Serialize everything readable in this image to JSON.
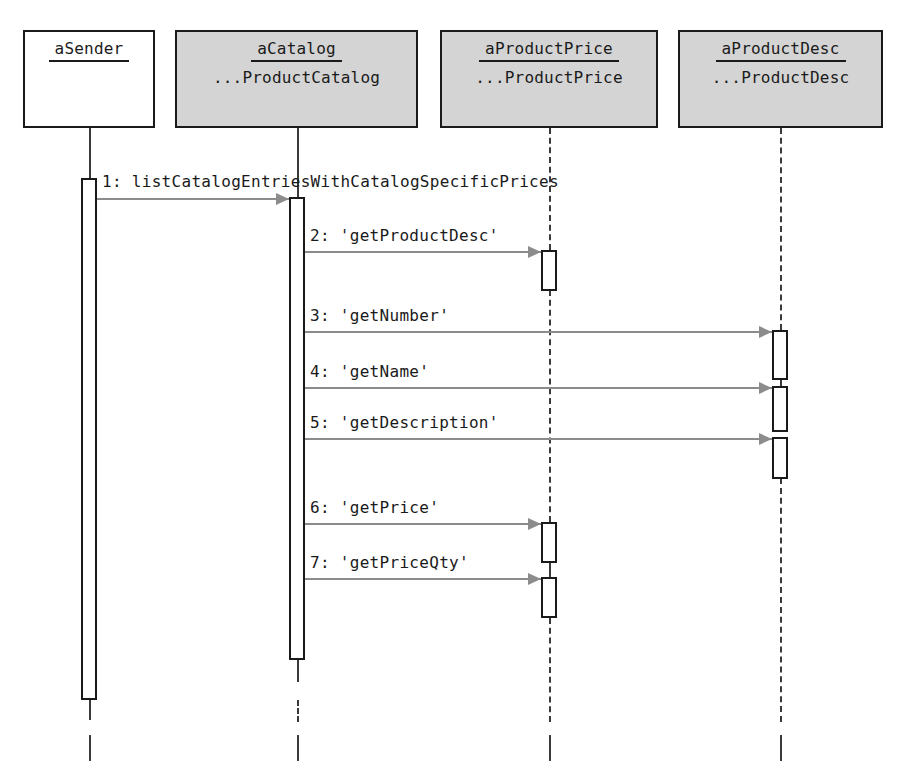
{
  "diagram": {
    "type": "uml-sequence-diagram",
    "title": "",
    "background_color": "#ffffff",
    "line_color": "#1a1a1a",
    "message_color": "#8c8c8c",
    "shaded_box_color": "#d4d4d4"
  },
  "participants": [
    {
      "id": "aSender",
      "name": "aSender",
      "class": "",
      "shaded": false,
      "box": {
        "x": 23,
        "y": 30,
        "w": 132,
        "h": 98
      },
      "lifeline_x": 89
    },
    {
      "id": "aCatalog",
      "name": "aCatalog",
      "class": "...ProductCatalog",
      "shaded": true,
      "box": {
        "x": 175,
        "y": 30,
        "w": 243,
        "h": 98
      },
      "lifeline_x": 297
    },
    {
      "id": "aProductPrice",
      "name": "aProductPrice",
      "class": "...ProductPrice",
      "shaded": true,
      "box": {
        "x": 440,
        "y": 30,
        "w": 218,
        "h": 98
      },
      "lifeline_x": 549
    },
    {
      "id": "aProductDesc",
      "name": "aProductDesc",
      "class": "...ProductDesc",
      "shaded": true,
      "box": {
        "x": 678,
        "y": 30,
        "w": 205,
        "h": 98
      },
      "lifeline_x": 780
    }
  ],
  "lifeline_segments": [
    {
      "participant": "aSender",
      "x": 89,
      "y": 128,
      "h": 52,
      "style": "solid"
    },
    {
      "participant": "aSender",
      "x": 89,
      "y": 698,
      "h": 22,
      "style": "solid"
    },
    {
      "participant": "aSender",
      "x": 89,
      "y": 735,
      "h": 26,
      "style": "solid"
    },
    {
      "participant": "aCatalog",
      "x": 297,
      "y": 128,
      "h": 70,
      "style": "solid"
    },
    {
      "participant": "aCatalog",
      "x": 297,
      "y": 660,
      "h": 22,
      "style": "solid"
    },
    {
      "participant": "aCatalog",
      "x": 297,
      "y": 700,
      "h": 22,
      "style": "dashed"
    },
    {
      "participant": "aCatalog",
      "x": 297,
      "y": 735,
      "h": 26,
      "style": "solid"
    },
    {
      "participant": "aProductPrice",
      "x": 549,
      "y": 128,
      "h": 122,
      "style": "dashed"
    },
    {
      "participant": "aProductPrice",
      "x": 549,
      "y": 290,
      "h": 232,
      "style": "dashed"
    },
    {
      "participant": "aProductPrice",
      "x": 549,
      "y": 563,
      "h": 14,
      "style": "solid"
    },
    {
      "participant": "aProductPrice",
      "x": 549,
      "y": 618,
      "h": 104,
      "style": "dashed"
    },
    {
      "participant": "aProductPrice",
      "x": 549,
      "y": 735,
      "h": 26,
      "style": "solid"
    },
    {
      "participant": "aProductDesc",
      "x": 780,
      "y": 128,
      "h": 202,
      "style": "dashed"
    },
    {
      "participant": "aProductDesc",
      "x": 780,
      "y": 380,
      "h": 8,
      "style": "solid"
    },
    {
      "participant": "aProductDesc",
      "x": 780,
      "y": 478,
      "h": 244,
      "style": "dashed"
    },
    {
      "participant": "aProductDesc",
      "x": 780,
      "y": 735,
      "h": 26,
      "style": "solid"
    }
  ],
  "activations": [
    {
      "participant": "aSender",
      "x": 81,
      "y": 178,
      "h": 522
    },
    {
      "participant": "aCatalog",
      "x": 289,
      "y": 197,
      "h": 463
    },
    {
      "participant": "aProductPrice",
      "x": 541,
      "y": 250,
      "h": 41
    },
    {
      "participant": "aProductDesc",
      "x": 772,
      "y": 330,
      "h": 50
    },
    {
      "participant": "aProductDesc",
      "x": 772,
      "y": 386,
      "h": 46
    },
    {
      "participant": "aProductDesc",
      "x": 772,
      "y": 437,
      "h": 42
    },
    {
      "participant": "aProductPrice",
      "x": 541,
      "y": 522,
      "h": 41
    },
    {
      "participant": "aProductPrice",
      "x": 541,
      "y": 577,
      "h": 41
    }
  ],
  "messages": [
    {
      "seq": "1",
      "label": "1: listCatalogEntriesWithCatalogSpecificPrices",
      "from": "aSender",
      "to": "aCatalog",
      "x1": 97,
      "x2": 289,
      "y": 198,
      "label_x": 102,
      "label_y": 172
    },
    {
      "seq": "2",
      "label": "2: 'getProductDesc'",
      "from": "aCatalog",
      "to": "aProductPrice",
      "x1": 305,
      "x2": 541,
      "y": 251,
      "label_x": 310,
      "label_y": 226
    },
    {
      "seq": "3",
      "label": "3: 'getNumber'",
      "from": "aCatalog",
      "to": "aProductDesc",
      "x1": 305,
      "x2": 772,
      "y": 331,
      "label_x": 310,
      "label_y": 306
    },
    {
      "seq": "4",
      "label": "4: 'getName'",
      "from": "aCatalog",
      "to": "aProductDesc",
      "x1": 305,
      "x2": 772,
      "y": 387,
      "label_x": 310,
      "label_y": 362
    },
    {
      "seq": "5",
      "label": "5: 'getDescription'",
      "from": "aCatalog",
      "to": "aProductDesc",
      "x1": 305,
      "x2": 772,
      "y": 438,
      "label_x": 310,
      "label_y": 413
    },
    {
      "seq": "6",
      "label": "6: 'getPrice'",
      "from": "aCatalog",
      "to": "aProductPrice",
      "x1": 305,
      "x2": 541,
      "y": 523,
      "label_x": 310,
      "label_y": 498
    },
    {
      "seq": "7",
      "label": "7: 'getPriceQty'",
      "from": "aCatalog",
      "to": "aProductPrice",
      "x1": 305,
      "x2": 541,
      "y": 578,
      "label_x": 310,
      "label_y": 553
    }
  ]
}
